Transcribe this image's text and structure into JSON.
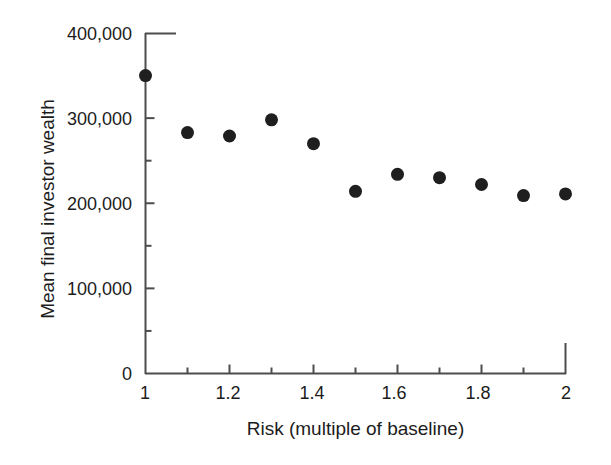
{
  "chart_data": {
    "type": "scatter",
    "title": "",
    "xlabel": "Risk (multiple of baseline)",
    "ylabel": "Mean final investor wealth",
    "x": [
      1,
      1.1,
      1.2,
      1.3,
      1.4,
      1.5,
      1.6,
      1.7,
      1.8,
      1.9,
      2
    ],
    "values": [
      350000,
      283000,
      279000,
      298000,
      270000,
      214000,
      234000,
      230000,
      222000,
      209000,
      211000
    ],
    "series": [
      {
        "name": "Mean final investor wealth",
        "values": [
          350000,
          283000,
          279000,
          298000,
          270000,
          214000,
          234000,
          230000,
          222000,
          209000,
          211000
        ]
      }
    ],
    "xlim": [
      1,
      2
    ],
    "ylim": [
      0,
      400000
    ],
    "xticks": [
      1,
      1.2,
      1.4,
      1.6,
      1.8,
      2
    ],
    "xtick_labels": [
      "1",
      "1.2",
      "1.4",
      "1.6",
      "1.8",
      "2"
    ],
    "yticks": [
      0,
      100000,
      200000,
      300000,
      400000
    ],
    "ytick_labels": [
      "0",
      "100,000",
      "200,000",
      "300,000",
      "400,000"
    ],
    "x_minor_ticks": [
      1.1,
      1.3,
      1.5,
      1.7,
      1.9
    ],
    "y_minor_ticks": [
      50000,
      150000,
      250000,
      350000
    ],
    "grid": false,
    "legend": null,
    "marker": "circle",
    "marker_color": "#1f1f1f",
    "marker_size": 13,
    "axis_color": "#4d4d4d",
    "background": "#ffffff"
  },
  "axes": {
    "y_title": "Mean final investor wealth",
    "x_title": "Risk (multiple of baseline)",
    "y_labels": [
      "400,000",
      "300,000",
      "200,000",
      "100,000",
      "0"
    ],
    "x_labels": [
      "1",
      "1.2",
      "1.4",
      "1.6",
      "1.8",
      "2"
    ]
  }
}
